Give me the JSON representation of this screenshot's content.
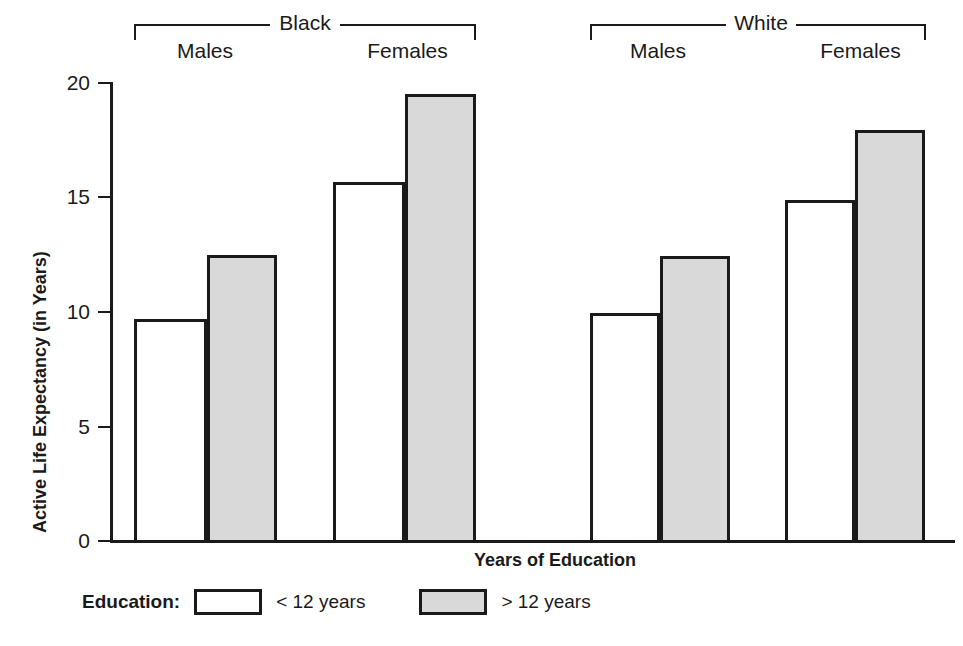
{
  "chart_data": {
    "type": "bar",
    "title": "",
    "xlabel": "Years of Education",
    "ylabel": "Active Life Expectancy (in Years)",
    "ylim": [
      0,
      20
    ],
    "yticks": [
      0,
      5,
      10,
      15,
      20
    ],
    "ytick_labels": [
      "0",
      "5",
      "10",
      "15",
      "20"
    ],
    "grid": false,
    "legend_position": "bottom-left",
    "groups": [
      {
        "name": "Black",
        "subgroups": [
          {
            "name": "Males",
            "values": [
              9.7,
              12.5
            ]
          },
          {
            "name": "Females",
            "values": [
              15.65,
              19.5
            ]
          }
        ]
      },
      {
        "name": "White",
        "subgroups": [
          {
            "name": "Males",
            "values": [
              10.0,
              12.45
            ]
          },
          {
            "name": "Females",
            "values": [
              14.9,
              17.9
            ]
          }
        ]
      }
    ],
    "series": [
      {
        "name": "< 12 years",
        "fill": "#ffffff",
        "values": [
          9.7,
          15.65,
          10.0,
          14.9
        ]
      },
      {
        "name": "> 12 years",
        "fill": "#d9d9d9",
        "values": [
          12.5,
          19.5,
          12.45,
          17.9
        ]
      }
    ],
    "categories": [
      "Black Males",
      "Black Females",
      "White Males",
      "White Females"
    ]
  },
  "axis": {
    "y_title": "Active Life Expectancy (in Years)",
    "x_title": "Years of Education",
    "tick_20": "20",
    "tick_15": "15",
    "tick_10": "10",
    "tick_5": "5",
    "tick_0": "0"
  },
  "groups": {
    "black": {
      "label": "Black",
      "males": "Males",
      "females": "Females"
    },
    "white": {
      "label": "White",
      "males": "Males",
      "females": "Females"
    }
  },
  "legend": {
    "title": "Education:",
    "items": [
      {
        "label": "< 12 years",
        "swatch": "white"
      },
      {
        "label": "> 12 years",
        "swatch": "gray"
      }
    ]
  },
  "colors": {
    "ink": "#1a1a1a",
    "bar_low_fill": "#ffffff",
    "bar_high_fill": "#d9d9d9",
    "background": "#ffffff"
  }
}
